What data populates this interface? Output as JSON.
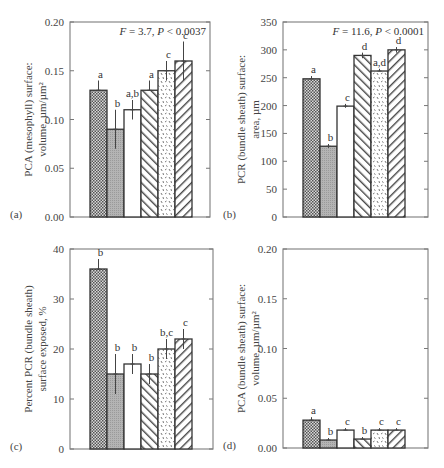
{
  "figure": {
    "treatments_count": 6,
    "patterns": [
      "crosshatch-dense",
      "gray-stipple",
      "open-white",
      "diagonal-back",
      "dashed-speckle",
      "diagonal-forward"
    ]
  },
  "chart_data": [
    {
      "type": "bar",
      "panel": "(a)",
      "ylabel_line1": "PCA (mesophyll) surface:",
      "ylabel_line2": "volume, µm/µm²",
      "stat": "F = 3.7, P < 0.0037",
      "stat_F": "F",
      "stat_F_val": " = 3.7, ",
      "stat_P": "P",
      "stat_P_val": " < 0.0037",
      "ylim": [
        0,
        0.2
      ],
      "yticks": [
        0.0,
        0.05,
        0.1,
        0.15,
        0.2
      ],
      "ytick_labels": [
        "0.00",
        "0.05",
        "0.10",
        "0.15",
        "0.20"
      ],
      "values": [
        0.13,
        0.09,
        0.11,
        0.13,
        0.15,
        0.16
      ],
      "err_upper": [
        0.14,
        0.11,
        0.12,
        0.14,
        0.16,
        0.18
      ],
      "err_lower": [
        0.13,
        0.07,
        0.1,
        0.13,
        0.14,
        0.14
      ],
      "letters": [
        "a",
        "b",
        "a,b",
        "a",
        "c",
        "c"
      ],
      "grid": false
    },
    {
      "type": "bar",
      "panel": "(b)",
      "ylabel_line1": "PCR (bundle sheath) surface:",
      "ylabel_line2": "area, µm",
      "stat": "F = 11.6, P < 0.0001",
      "stat_F": "F",
      "stat_F_val": " = 11.6, ",
      "stat_P": "P",
      "stat_P_val": " < 0.0001",
      "ylim": [
        0,
        350
      ],
      "yticks": [
        0,
        50,
        100,
        150,
        200,
        250,
        300,
        350
      ],
      "ytick_labels": [
        "0",
        "50",
        "100",
        "150",
        "200",
        "250",
        "300",
        "350"
      ],
      "values": [
        248,
        127,
        199,
        290,
        262,
        300
      ],
      "err_upper": [
        253,
        131,
        203,
        295,
        266,
        305
      ],
      "err_lower": [
        248,
        124,
        196,
        285,
        262,
        295
      ],
      "letters": [
        "a",
        "b",
        "c",
        "d",
        "a,d",
        "d"
      ],
      "grid": false
    },
    {
      "type": "bar",
      "panel": "(c)",
      "ylabel_line1": "Percent PCR (bundle sheath)",
      "ylabel_line2": "surface exposed, %",
      "stat": "",
      "ylim": [
        0,
        40
      ],
      "yticks": [
        0,
        10,
        20,
        30,
        40
      ],
      "ytick_labels": [
        "0",
        "10",
        "20",
        "30",
        "40"
      ],
      "values": [
        36,
        15,
        17,
        15,
        20,
        22
      ],
      "err_upper": [
        38,
        19,
        19,
        17,
        22,
        24
      ],
      "err_lower": [
        36,
        11,
        15,
        13,
        18,
        20
      ],
      "letters": [
        "b",
        "b",
        "b",
        "b",
        "b,c",
        "c"
      ],
      "grid": false
    },
    {
      "type": "bar",
      "panel": "(d)",
      "ylabel_line1": "PCA (bundle sheath) surface:",
      "ylabel_line2": "volume, µm/µm²",
      "stat": "",
      "ylim": [
        0,
        0.2
      ],
      "yticks": [
        0.0,
        0.05,
        0.1,
        0.15,
        0.2
      ],
      "ytick_labels": [
        "0.00",
        "0.05",
        "0.10",
        "0.15",
        "0.20"
      ],
      "values": [
        0.028,
        0.008,
        0.018,
        0.009,
        0.018,
        0.018
      ],
      "err_upper": [
        0.031,
        0.01,
        0.02,
        0.011,
        0.02,
        0.02
      ],
      "err_lower": [
        0.028,
        0.008,
        0.018,
        0.009,
        0.018,
        0.018
      ],
      "letters": [
        "a",
        "b",
        "c",
        "b",
        "c",
        "c"
      ],
      "grid": false
    }
  ]
}
